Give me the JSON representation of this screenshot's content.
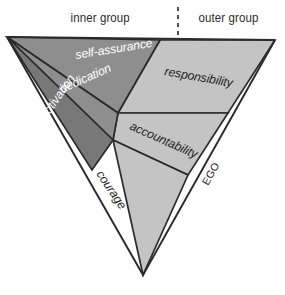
{
  "header": {
    "inner_label": "inner group",
    "outer_label": "outer group",
    "divider": "dashed-vertical-divider"
  },
  "diagram": {
    "title_axis_label": "EGO",
    "shape": "inverted-triangle",
    "inner_group": {
      "fill": "#8e8e8e",
      "text_color": "#ffffff",
      "segments": [
        {
          "id": "self-assurance",
          "label": "self-assurance"
        },
        {
          "id": "dedication",
          "label": "dedication"
        },
        {
          "id": "motivation",
          "label": "motivation",
          "fill": "#787878"
        }
      ]
    },
    "outer_group": {
      "fill": "#c4c4c4",
      "text_color": "#1d1d1d",
      "segments": [
        {
          "id": "responsibility",
          "label": "responsibility"
        },
        {
          "id": "accountability",
          "label": "accountability"
        },
        {
          "id": "courage",
          "label": "courage"
        }
      ]
    },
    "colors": {
      "outline": "#2b2b2b",
      "inner_fill": "#8e8e8e",
      "inner_fill_dark": "#787878",
      "outer_fill": "#c4c4c4",
      "background": "#ffffff",
      "header_text": "#2b2b2b"
    }
  }
}
